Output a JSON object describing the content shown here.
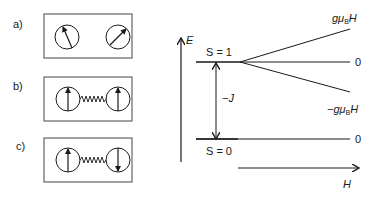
{
  "panels": [
    {
      "label": "a)",
      "description": "two uncoupled spins, random orientation"
    },
    {
      "label": "b)",
      "description": "two coupled spins, parallel (ferromagnetic)"
    },
    {
      "label": "c)",
      "description": "two coupled spins, antiparallel (antiferromagnetic)"
    }
  ],
  "energy_diagram": {
    "y_axis_label": "E",
    "x_axis_label": "H",
    "upper_level_label": "S = 1",
    "lower_level_label": "S = 0",
    "gap_label": "−J",
    "branches": {
      "upper": "gμ",
      "upper_sub": "B",
      "upper_suffix": "H",
      "middle": "0",
      "lower": "−gμ",
      "lower_sub": "B",
      "lower_suffix": "H",
      "ground": "0"
    }
  },
  "colors": {
    "line": "#1a1a1a",
    "box": "#444444"
  }
}
